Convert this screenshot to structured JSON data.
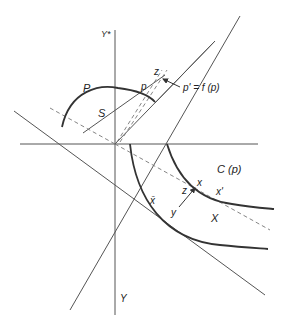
{
  "diagram": {
    "type": "economic-geometry",
    "colors": {
      "line": "#555555",
      "thick": "#333333",
      "dashed": "#777777",
      "text": "#222222"
    },
    "labels": {
      "y_star_axis": "Y*",
      "y_axis": "Y",
      "P": "P",
      "S": "S",
      "p": "p",
      "z_top": "z",
      "p_prime": "p' = f (p)",
      "C_p": "C (p)",
      "x": "x",
      "x_prime": "x'",
      "z_bottom": "z",
      "x_bar": "x̄",
      "y": "y",
      "X": "X"
    }
  }
}
